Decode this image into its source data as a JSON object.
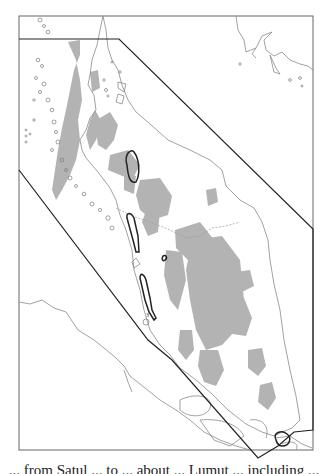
{
  "figure": {
    "type": "map",
    "frame": {
      "x": 19,
      "y": 16,
      "width": 294,
      "height": 434,
      "stroke": "#555555"
    },
    "colors": {
      "land_shade": "#b3b3b3",
      "coastline": "#8a8a8a",
      "boundary": "#333333",
      "highlight_outline": "#222222",
      "background": "#ffffff"
    },
    "labels": {
      "marker_3": "3"
    },
    "caption_partial": "... from Satul ... to ... about ... Lumut ... including ..."
  }
}
